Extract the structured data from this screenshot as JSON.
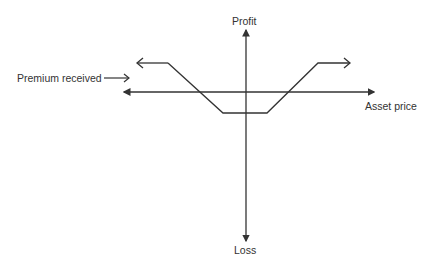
{
  "diagram": {
    "type": "payoff-diagram",
    "axes": {
      "y_top_label": "Profit",
      "y_bottom_label": "Loss",
      "x_label": "Asset price"
    },
    "annotation": {
      "label": "Premium received",
      "arrow": "right"
    },
    "colors": {
      "line": "#333333",
      "text": "#333333",
      "background": "#ffffff"
    }
  }
}
